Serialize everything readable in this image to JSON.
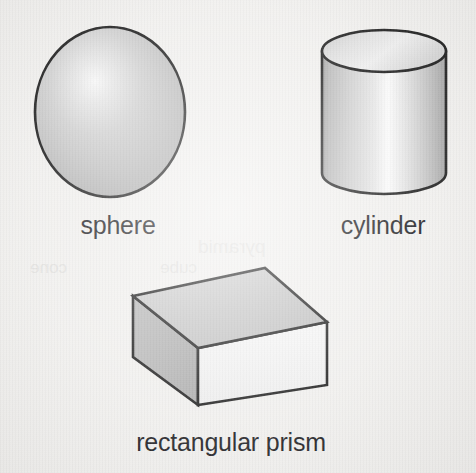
{
  "page": {
    "background_color": "#f1f0ee",
    "width": 476,
    "height": 473
  },
  "figure": {
    "kind": "geometric-solids-illustration",
    "outline_color": "#111111",
    "shapes": [
      {
        "id": "sphere",
        "label": "sphere",
        "type": "sphere",
        "center": [
          110,
          112
        ],
        "radius_x": 75,
        "radius_y": 85,
        "fill_light": "#f4f4f4",
        "fill_mid": "#c9c9c9",
        "fill_dark": "#a8a8a8",
        "highlight": [
          95,
          85
        ]
      },
      {
        "id": "cylinder",
        "label": "cylinder",
        "type": "cylinder",
        "left": 322,
        "right": 446,
        "top": 30,
        "bottom": 194,
        "ellipse_ry": 21,
        "fill_light": "#fdfdfd",
        "fill_mid": "#d2d2d2",
        "fill_dark": "#a9a9a9"
      },
      {
        "id": "rectangular-prism",
        "label": "rectangular prism",
        "type": "rectangular-prism",
        "vertices": {
          "top_back_left": [
            133,
            296
          ],
          "top_back_right": [
            265,
            268
          ],
          "top_front_right": [
            327,
            322
          ],
          "top_front_left": [
            198,
            348
          ],
          "bottom_front_left": [
            198,
            405
          ],
          "bottom_front_right": [
            327,
            385
          ],
          "bottom_back_left": [
            133,
            357
          ]
        },
        "face_top": "#c6c6c6",
        "face_left": "#b3b3b3",
        "face_front": "#f2f2f2"
      }
    ]
  },
  "ghost_artifacts": {
    "note": "faint show-through marks from reverse of printed page",
    "line_a": "pyramid",
    "line_b": "cone",
    "line_c": "cube"
  }
}
